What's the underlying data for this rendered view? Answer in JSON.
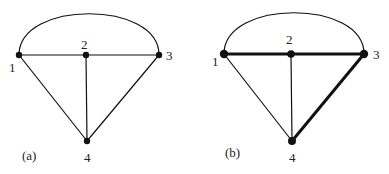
{
  "figures": [
    {
      "caption": "(a)",
      "nodes": [
        {
          "id": "1",
          "label": "1"
        },
        {
          "id": "2",
          "label": "2"
        },
        {
          "id": "3",
          "label": "3"
        },
        {
          "id": "4",
          "label": "4"
        }
      ],
      "edges": [
        {
          "from": "1",
          "to": "2",
          "bold": false
        },
        {
          "from": "2",
          "to": "3",
          "bold": false
        },
        {
          "from": "1",
          "to": "4",
          "bold": false
        },
        {
          "from": "2",
          "to": "4",
          "bold": false
        },
        {
          "from": "3",
          "to": "4",
          "bold": false
        },
        {
          "from": "1",
          "to": "3",
          "curved": true,
          "bold": false
        }
      ]
    },
    {
      "caption": "(b)",
      "nodes": [
        {
          "id": "1",
          "label": "1"
        },
        {
          "id": "2",
          "label": "2"
        },
        {
          "id": "3",
          "label": "3"
        },
        {
          "id": "4",
          "label": "4"
        }
      ],
      "edges": [
        {
          "from": "1",
          "to": "2",
          "bold": true
        },
        {
          "from": "2",
          "to": "3",
          "bold": true
        },
        {
          "from": "3",
          "to": "4",
          "bold": true
        },
        {
          "from": "1",
          "to": "4",
          "bold": false
        },
        {
          "from": "2",
          "to": "4",
          "bold": false
        },
        {
          "from": "1",
          "to": "3",
          "curved": true,
          "bold": false
        }
      ]
    }
  ],
  "colors": {
    "stroke": "#111111",
    "background": "#ffffff"
  }
}
